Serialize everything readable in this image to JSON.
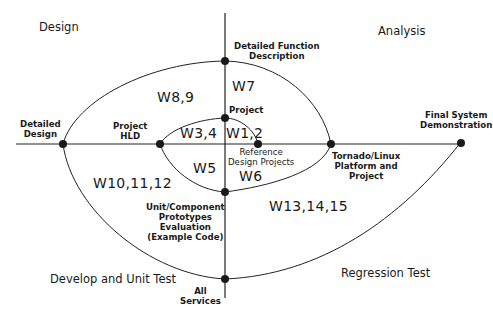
{
  "quadrants": {
    "top_left": "Design",
    "top_right": "Analysis",
    "bottom_left": "Develop and Unit Test",
    "bottom_right": "Regression Test"
  },
  "nodes": {
    "detailed_design": {
      "line1": "Detailed",
      "line2": "Design"
    },
    "project_hld": {
      "line1": "Project",
      "line2": "HLD"
    },
    "detailed_function": {
      "line1": "Detailed Function",
      "line2": "Description"
    },
    "project": {
      "line1": "Project"
    },
    "reference_design": {
      "line1": "Reference",
      "line2": "Design Projects"
    },
    "tornado": {
      "line1": "Tornado/Linux",
      "line2": "Platform and",
      "line3": "Project"
    },
    "final_system": {
      "line1": "Final System",
      "line2": "Demonstration"
    },
    "unit_component": {
      "line1": "Unit/Component",
      "line2": "Prototypes",
      "line3": "Evaluation",
      "line4": "(Example Code)"
    },
    "all_services": {
      "line1": "All",
      "line2": "Services"
    }
  },
  "weeks": {
    "w1_2": "W1,2",
    "w3_4": "W3,4",
    "w5": "W5",
    "w6": "W6",
    "w7": "W7",
    "w8_9": "W8,9",
    "w10_12": "W10,11,12",
    "w13_15": "W13,14,15"
  },
  "colors": {
    "line": "#222222",
    "node": "#1a1a1a",
    "background": "#ffffff"
  }
}
